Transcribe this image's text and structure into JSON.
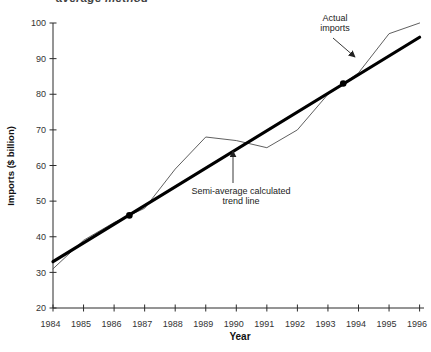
{
  "page": {
    "clipped_heading": "average method"
  },
  "annotations": {
    "actual_line1": "Actual",
    "actual_line2": "imports",
    "trend_line1": "Semi-average calculated",
    "trend_line2": "trend line"
  },
  "chart_data": {
    "type": "line",
    "xlabel": "Year",
    "ylabel": "Imports ($ billion)",
    "x_ticks": [
      "1984",
      "1985",
      "1986",
      "1987",
      "1988",
      "1989",
      "1990",
      "1991",
      "1992",
      "1993",
      "1994",
      "1995",
      "1996"
    ],
    "y_ticks": [
      20,
      30,
      40,
      50,
      60,
      70,
      80,
      90,
      100
    ],
    "xlim": [
      1984,
      1996
    ],
    "ylim": [
      20,
      100
    ],
    "grid": false,
    "legend_position": "none",
    "colors": {
      "actual_line": "#4d4d4d",
      "trend_line": "#000000",
      "axis": "#2b2b2b"
    },
    "series": [
      {
        "name": "Actual imports",
        "style": "thin",
        "x": [
          1984,
          1985,
          1986,
          1987,
          1988,
          1989,
          1990,
          1991,
          1992,
          1993,
          1994,
          1995,
          1996
        ],
        "values": [
          31,
          39,
          44,
          48,
          59,
          68,
          67,
          65,
          70,
          80,
          86,
          97,
          100
        ]
      },
      {
        "name": "Semi-average calculated trend line",
        "style": "thick",
        "x": [
          1984,
          1996
        ],
        "values": [
          33,
          96
        ]
      }
    ],
    "markers": {
      "name": "semi-average points",
      "points": [
        {
          "x": 1986.5,
          "value": 46
        },
        {
          "x": 1993.5,
          "value": 83
        }
      ]
    }
  }
}
